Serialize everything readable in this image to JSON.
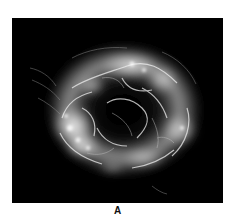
{
  "figure": {
    "panel_label": "A",
    "background_color": "#000000",
    "nebula_color": "#ffffff"
  }
}
